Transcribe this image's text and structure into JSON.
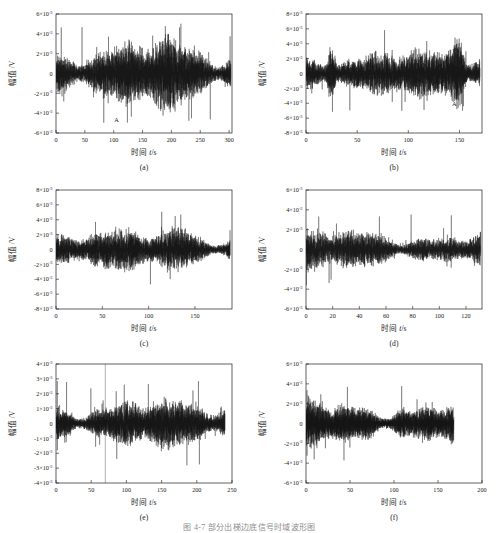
{
  "figure": {
    "caption": "图 4-7   部分出梯边底信号时域波形图",
    "amplitude_axis_label": "幅值 /V",
    "time_axis_label_prefix": "时间 ",
    "time_axis_label_italic": "t",
    "time_axis_label_suffix": "/s",
    "exponent_prefix": "×10",
    "exponent_value": "-3",
    "annotation_label": "A",
    "trace_color": "#121212",
    "axis_color": "#1d1d1d",
    "background_color": "#ffffff"
  },
  "chart_data": [
    {
      "type": "line",
      "id": "a",
      "sublabel": "(a)",
      "title": "",
      "xlabel": "时间 t/s",
      "ylabel": "幅值 /V",
      "xlim": [
        0,
        305
      ],
      "ylim": [
        -0.006,
        0.006
      ],
      "xticks": [
        0,
        50,
        100,
        150,
        200,
        250,
        300
      ],
      "yticks": [
        -0.006,
        -0.004,
        -0.002,
        0,
        0.002,
        0.004,
        0.006
      ],
      "ytick_labels": [
        "-6×10⁻³",
        "-4×10⁻³",
        "-2×10⁻³",
        "0",
        "2×10⁻³",
        "4×10⁻³",
        "6×10⁻³"
      ],
      "grid": false,
      "legend": null,
      "annotations": [
        {
          "text": "A",
          "x": 105,
          "y": -0.0049
        }
      ],
      "noise_envelope": 0.0021,
      "spike_envelope": 0.0052,
      "n_points": 1600,
      "seed": 11,
      "description": "Broadband random vibration signal, amplitude roughly ±2×10⁻³ V with spikes to ±5×10⁻³ V"
    },
    {
      "type": "line",
      "id": "b",
      "sublabel": "(b)",
      "title": "",
      "xlabel": "时间 t/s",
      "ylabel": "幅值 /V",
      "xlim": [
        0,
        172
      ],
      "ylim": [
        -0.008,
        0.008
      ],
      "xticks": [
        0,
        50,
        100,
        150
      ],
      "yticks": [
        -0.008,
        -0.006,
        -0.004,
        -0.002,
        0,
        0.002,
        0.004,
        0.006,
        0.008
      ],
      "ytick_labels": [
        "-8×10⁻³",
        "-6×10⁻³",
        "-4×10⁻³",
        "-2×10⁻³",
        "0",
        "2×10⁻³",
        "4×10⁻³",
        "6×10⁻³",
        "8×10⁻³"
      ],
      "grid": false,
      "legend": null,
      "annotations": [
        {
          "text": "A",
          "x": 145,
          "y": -0.0044
        }
      ],
      "noise_envelope": 0.0022,
      "spike_envelope": 0.0068,
      "n_points": 1600,
      "seed": 23,
      "description": "Random vibration with large transient bursts near t=25 s and t=150 s reaching ±7×10⁻³ V"
    },
    {
      "type": "line",
      "id": "c",
      "sublabel": "(c)",
      "title": "",
      "xlabel": "时间 t/s",
      "ylabel": "幅值 /V",
      "xlim": [
        0,
        190
      ],
      "ylim": [
        -0.008,
        0.008
      ],
      "xticks": [
        0,
        50,
        100,
        150
      ],
      "yticks": [
        -0.008,
        -0.006,
        -0.004,
        -0.002,
        0,
        0.002,
        0.004,
        0.006,
        0.008
      ],
      "ytick_labels": [
        "-8×10⁻³",
        "-6×10⁻³",
        "-4×10⁻³",
        "-2×10⁻³",
        "0",
        "2×10⁻³",
        "4×10⁻³",
        "6×10⁻³",
        "8×10⁻³"
      ],
      "grid": false,
      "legend": null,
      "annotations": [],
      "noise_envelope": 0.0018,
      "spike_envelope": 0.0057,
      "n_points": 1500,
      "seed": 37,
      "description": "Random vibration, denser high-amplitude activity after t ≈ 120 s"
    },
    {
      "type": "line",
      "id": "d",
      "sublabel": "(d)",
      "title": "",
      "xlabel": "时间 t/s",
      "ylabel": "幅值 /V",
      "xlim": [
        0,
        132
      ],
      "ylim": [
        -0.006,
        0.006
      ],
      "xticks": [
        0,
        20,
        40,
        60,
        80,
        100,
        120
      ],
      "yticks": [
        -0.006,
        -0.004,
        -0.002,
        0,
        0.002,
        0.004,
        0.006
      ],
      "ytick_labels": [
        "-6×10⁻³",
        "-4×10⁻³",
        "-2×10⁻³",
        "0",
        "2×10⁻³",
        "4×10⁻³",
        "6×10⁻³"
      ],
      "grid": false,
      "legend": null,
      "annotations": [],
      "noise_envelope": 0.0014,
      "spike_envelope": 0.004,
      "n_points": 1400,
      "seed": 51,
      "description": "Lower amplitude random vibration, mostly within ±2×10⁻³ V with a spike near t ≈ 94 s"
    },
    {
      "type": "line",
      "id": "e",
      "sublabel": "(e)",
      "title": "",
      "xlabel": "时间 t/s",
      "ylabel": "幅值 /V",
      "xlim": [
        0,
        250
      ],
      "ylim": [
        -0.004,
        0.004
      ],
      "xticks": [
        0,
        50,
        100,
        150,
        200,
        250
      ],
      "yticks": [
        -0.004,
        -0.003,
        -0.002,
        -0.001,
        0,
        0.001,
        0.002,
        0.003,
        0.004
      ],
      "ytick_labels": [
        "-4×10⁻³",
        "-3×10⁻³",
        "-2×10⁻³",
        "-1×10⁻³",
        "0",
        "1×10⁻³",
        "2×10⁻³",
        "3×10⁻³",
        "4×10⁻³"
      ],
      "grid": false,
      "legend": null,
      "annotations": [],
      "noise_envelope": 0.0011,
      "spike_envelope": 0.003,
      "n_points": 1600,
      "seed": 67,
      "description": "Random vibration spanning 0–240 s with a full-height vertical transient at t ≈ 70 s"
    },
    {
      "type": "line",
      "id": "f",
      "sublabel": "(f)",
      "title": "",
      "xlabel": "时间 t/s",
      "ylabel": "幅值 /V",
      "xlim": [
        0,
        200
      ],
      "ylim": [
        -0.006,
        0.006
      ],
      "xticks": [
        0,
        50,
        100,
        150,
        200
      ],
      "yticks": [
        -0.006,
        -0.004,
        -0.002,
        0,
        0.002,
        0.004,
        0.006
      ],
      "ytick_labels": [
        "-6×10⁻³",
        "-4×10⁻³",
        "-2×10⁻³",
        "0",
        "2×10⁻³",
        "4×10⁻³",
        "6×10⁻³"
      ],
      "grid": false,
      "legend": null,
      "annotations": [],
      "noise_envelope": 0.0016,
      "spike_envelope": 0.0044,
      "n_points": 1500,
      "seed": 83,
      "description": "Random vibration occupying 0–168 s of a 0–200 s axis, amplitude within ±3×10⁻³ V"
    }
  ],
  "panel_positions": [
    {
      "id": "a",
      "left": 0,
      "top": 2
    },
    {
      "id": "b",
      "left": 250,
      "top": 2
    },
    {
      "id": "c",
      "left": 0,
      "top": 178
    },
    {
      "id": "d",
      "left": 250,
      "top": 178
    },
    {
      "id": "e",
      "left": 0,
      "top": 352
    },
    {
      "id": "f",
      "left": 250,
      "top": 352
    }
  ]
}
